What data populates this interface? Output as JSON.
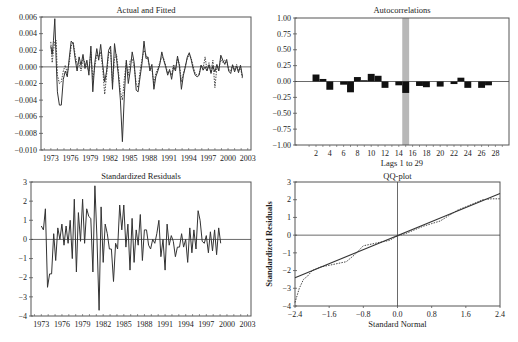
{
  "chart_data": [
    {
      "id": "actual_fitted",
      "type": "line",
      "title": "Actual and Fitted",
      "xlabel": "",
      "ylabel": "",
      "ylim": [
        -0.01,
        0.006
      ],
      "xlim": [
        1971.5,
        2003.5
      ],
      "yticks": [
        0.006,
        0.004,
        0.002,
        0.0,
        -0.002,
        -0.004,
        -0.006,
        -0.008,
        -0.01
      ],
      "ytick_labels": [
        "0.006",
        "0.004",
        "0.002",
        "0.000",
        "−0.002",
        "−0.004",
        "−0.006",
        "−0.008",
        "−0.010"
      ],
      "xticks": [
        1973,
        1976,
        1979,
        1982,
        1985,
        1988,
        1991,
        1994,
        1997,
        2000,
        2003
      ],
      "grid": false,
      "legend": "none",
      "series": [
        {
          "name": "Actual",
          "style": "solid",
          "x": [
            1973.0,
            1973.2,
            1973.4,
            1973.6,
            1973.8,
            1974.0,
            1974.3,
            1974.6,
            1974.9,
            1975.2,
            1975.5,
            1975.8,
            1976.1,
            1976.4,
            1976.7,
            1977.0,
            1977.3,
            1977.6,
            1977.9,
            1978.2,
            1978.5,
            1978.8,
            1979.1,
            1979.4,
            1979.7,
            1980.0,
            1980.3,
            1980.6,
            1980.9,
            1981.2,
            1981.5,
            1981.8,
            1982.1,
            1982.4,
            1982.7,
            1983.0,
            1983.3,
            1983.6,
            1983.9,
            1984.2,
            1984.5,
            1984.8,
            1985.1,
            1985.4,
            1985.7,
            1986.0,
            1986.3,
            1986.6,
            1986.9,
            1987.2,
            1987.5,
            1987.8,
            1988.1,
            1988.4,
            1988.7,
            1989.0,
            1989.3,
            1989.6,
            1989.9,
            1990.2,
            1990.5,
            1990.8,
            1991.1,
            1991.4,
            1991.7,
            1992.0,
            1992.3,
            1992.6,
            1992.9,
            1993.2,
            1993.5,
            1993.8,
            1994.1,
            1994.4,
            1994.7,
            1995.0,
            1995.3,
            1995.6,
            1995.9,
            1996.2,
            1996.5,
            1996.8,
            1997.1,
            1997.4,
            1997.7,
            1998.0,
            1998.3,
            1998.6,
            1998.9,
            1999.2,
            1999.5,
            1999.8,
            2000.1,
            2000.4,
            2000.7,
            2001.0,
            2001.3,
            2001.6,
            2001.9,
            2002.2
          ],
          "y": [
            0.0025,
            0.0015,
            0.0032,
            0.0058,
            0.001,
            -0.003,
            -0.0046,
            -0.0046,
            -0.0015,
            -0.0005,
            -0.0012,
            0.001,
            0.0031,
            0.0028,
            0.001,
            -0.0005,
            0.0012,
            0.0002,
            0.0015,
            -0.0002,
            0.0008,
            -0.001,
            0.0025,
            -0.003,
            0.0005,
            0.0022,
            0.0008,
            0.0027,
            0.0003,
            -0.0018,
            -0.0005,
            0.002,
            0.0025,
            -0.0027,
            0.0028,
            0.001,
            -0.001,
            -0.004,
            -0.009,
            -0.0035,
            0.0008,
            -0.002,
            -0.0005,
            0.0018,
            0.0005,
            -0.0028,
            -0.003,
            -0.0012,
            0.0005,
            0.0031,
            0.001,
            0.0012,
            -0.0005,
            0.0003,
            -0.0027,
            -0.0012,
            -0.0005,
            0.0003,
            0.0018,
            0.0008,
            0.0,
            -0.001,
            -0.0003,
            -0.0015,
            0.0,
            -0.0005,
            0.0013,
            0.0,
            -0.0027,
            -0.001,
            0.0,
            0.0012,
            0.0017,
            0.0008,
            -0.0003,
            -0.001,
            -0.0012,
            -0.001,
            0.0002,
            -0.0004,
            0.0,
            -0.0005,
            0.0002,
            -0.0008,
            0.0001,
            -0.0006,
            0.0003,
            -0.0005,
            0.0014,
            0.0008,
            0.0003,
            0.0009,
            -0.0005,
            -0.0008,
            0.0002,
            -0.0006,
            0.0001,
            -0.0007,
            0.0002,
            -0.0012
          ]
        },
        {
          "name": "Fitted",
          "style": "dotted",
          "x": [
            1973.0,
            1973.2,
            1973.4,
            1973.6,
            1973.8,
            1974.0,
            1974.3,
            1974.6,
            1974.9,
            1975.2,
            1975.5,
            1975.8,
            1976.1,
            1976.4,
            1976.7,
            1977.0,
            1977.3,
            1977.6,
            1977.9,
            1978.2,
            1978.5,
            1978.8,
            1979.1,
            1979.4,
            1979.7,
            1980.0,
            1980.3,
            1980.6,
            1980.9,
            1981.2,
            1981.5,
            1981.8,
            1982.1,
            1982.4,
            1982.7,
            1983.0,
            1983.3,
            1983.6,
            1983.9,
            1984.2,
            1984.5,
            1984.8,
            1985.1,
            1985.4,
            1985.7,
            1986.0,
            1986.3,
            1986.6,
            1986.9,
            1987.2,
            1987.5,
            1987.8,
            1988.1,
            1988.4,
            1988.7,
            1989.0,
            1989.3,
            1989.6,
            1989.9,
            1990.2,
            1990.5,
            1990.8,
            1991.1,
            1991.4,
            1991.7,
            1992.0,
            1992.3,
            1992.6,
            1992.9,
            1993.2,
            1993.5,
            1993.8,
            1994.1,
            1994.4,
            1994.7,
            1995.0,
            1995.3,
            1995.6,
            1995.9,
            1996.2,
            1996.5,
            1996.8,
            1997.1,
            1997.4,
            1997.7,
            1998.0,
            1998.3,
            1998.6,
            1998.9,
            1999.2,
            1999.5,
            1999.8,
            2000.1,
            2000.4,
            2000.7,
            2001.0,
            2001.3,
            2001.6,
            2001.9,
            2002.2
          ],
          "y": [
            0.003,
            0.0005,
            0.002,
            0.003,
            0.0032,
            -0.001,
            -0.002,
            -0.0018,
            -0.0005,
            0.0002,
            -0.0008,
            0.0005,
            0.0025,
            0.003,
            0.0015,
            0.0003,
            0.0005,
            -0.0005,
            0.001,
            0.0005,
            0.0,
            -0.0005,
            0.0018,
            -0.0015,
            0.0,
            0.0015,
            0.0012,
            0.0018,
            -0.0002,
            -0.0033,
            -0.001,
            0.0015,
            0.002,
            -0.002,
            0.001,
            0.0015,
            -0.0005,
            -0.003,
            -0.004,
            -0.0015,
            0.0005,
            -0.001,
            0.0008,
            0.001,
            0.0,
            -0.002,
            -0.0025,
            -0.0005,
            0.001,
            0.002,
            0.0015,
            0.0008,
            0.0,
            -0.0003,
            -0.002,
            -0.0008,
            -0.0002,
            0.0005,
            0.0012,
            0.001,
            0.0002,
            -0.0008,
            -0.0005,
            -0.001,
            0.0003,
            -0.0003,
            0.001,
            0.0003,
            -0.0018,
            -0.0008,
            0.0002,
            0.001,
            0.0015,
            0.001,
            0.0,
            -0.0008,
            -0.001,
            -0.0008,
            0.0002,
            -0.0002,
            0.0012,
            -0.0004,
            0.0005,
            -0.0006,
            0.0008,
            -0.0025,
            0.0,
            -0.0003,
            0.001,
            0.0005,
            0.0008,
            0.0006,
            -0.0003,
            -0.0005,
            0.0003,
            -0.0004,
            0.0003,
            -0.0005,
            0.0,
            -0.0015
          ]
        }
      ]
    },
    {
      "id": "autocorrelations",
      "type": "bar",
      "title": "Autocorrelations",
      "xlabel": "Lags 1 to 29",
      "ylabel": "",
      "ylim": [
        -1.0,
        1.0
      ],
      "yticks": [
        1.0,
        0.75,
        0.5,
        0.25,
        0.0,
        -0.25,
        -0.5,
        -0.75,
        -1.0
      ],
      "ytick_labels": [
        "1.00",
        "0.75",
        "0.50",
        "0.25",
        "0.00",
        "−0.25",
        "−0.50",
        "−0.75",
        "−1.00"
      ],
      "xticks": [
        2,
        4,
        6,
        8,
        10,
        12,
        14,
        16,
        18,
        20,
        22,
        24,
        26,
        28
      ],
      "highlight_lag": 15,
      "grid": false,
      "legend": "none",
      "categories": [
        1,
        2,
        3,
        4,
        5,
        6,
        7,
        8,
        9,
        10,
        11,
        12,
        13,
        14,
        15,
        16,
        17,
        18,
        19,
        20,
        21,
        22,
        23,
        24,
        25,
        26,
        27,
        28,
        29
      ],
      "values": [
        0.0,
        0.11,
        0.04,
        -0.13,
        0.0,
        -0.05,
        -0.17,
        0.07,
        0.02,
        0.12,
        0.09,
        -0.1,
        0.0,
        -0.06,
        -0.18,
        0.0,
        -0.07,
        -0.09,
        0.0,
        -0.08,
        0.0,
        -0.04,
        0.06,
        -0.1,
        0.0,
        -0.1,
        -0.06,
        0.0,
        0.0
      ]
    },
    {
      "id": "standardized_residuals",
      "type": "line",
      "title": "Standardized Residuals",
      "xlabel": "",
      "ylabel": "",
      "ylim": [
        -4,
        3
      ],
      "xlim": [
        1971.5,
        2003.5
      ],
      "yticks": [
        3,
        2,
        1,
        0,
        -1,
        -2,
        -3,
        -4
      ],
      "ytick_labels": [
        "3",
        "2",
        "1",
        "0",
        "−1",
        "−2",
        "−3",
        "−4"
      ],
      "xticks": [
        1973,
        1976,
        1979,
        1982,
        1985,
        1988,
        1991,
        1994,
        1997,
        2000,
        2003
      ],
      "grid": false,
      "legend": "none",
      "series": [
        {
          "name": "Standardized Residuals",
          "x": [
            1973.0,
            1973.3,
            1973.6,
            1973.9,
            1974.2,
            1974.5,
            1974.8,
            1975.1,
            1975.4,
            1975.7,
            1976.0,
            1976.3,
            1976.6,
            1976.9,
            1977.2,
            1977.5,
            1977.8,
            1978.1,
            1978.4,
            1978.7,
            1979.0,
            1979.3,
            1979.6,
            1979.9,
            1980.2,
            1980.5,
            1980.8,
            1981.1,
            1981.4,
            1981.7,
            1982.0,
            1982.3,
            1982.6,
            1982.9,
            1983.2,
            1983.5,
            1983.8,
            1984.1,
            1984.4,
            1984.7,
            1985.0,
            1985.3,
            1985.6,
            1985.9,
            1986.2,
            1986.5,
            1986.8,
            1987.1,
            1987.4,
            1987.7,
            1988.0,
            1988.3,
            1988.6,
            1988.9,
            1989.2,
            1989.5,
            1989.8,
            1990.1,
            1990.4,
            1990.7,
            1991.0,
            1991.3,
            1991.6,
            1991.9,
            1992.2,
            1992.5,
            1992.8,
            1993.1,
            1993.4,
            1993.7,
            1994.0,
            1994.3,
            1994.6,
            1994.9,
            1995.2,
            1995.5,
            1995.8,
            1996.1,
            1996.4,
            1996.7,
            1997.0,
            1997.3,
            1997.6,
            1997.9,
            1998.2,
            1998.5,
            1998.8,
            1999.1,
            1999.4,
            1999.7,
            2000.0,
            2000.3,
            2000.6,
            2000.9,
            2001.2,
            2001.5,
            2001.8,
            2002.1,
            2002.4
          ],
          "y": [
            0.7,
            0.5,
            1.6,
            -2.5,
            -1.8,
            -1.8,
            0.3,
            -1.1,
            0.6,
            0.0,
            0.8,
            -0.3,
            0.7,
            -0.2,
            1.0,
            -1.0,
            2.1,
            -1.7,
            1.4,
            -0.1,
            2.1,
            -0.2,
            1.6,
            1.2,
            1.1,
            -1.7,
            2.8,
            0.0,
            -3.7,
            1.7,
            -1.2,
            0.8,
            0.3,
            -0.5,
            -0.5,
            -2.2,
            -0.2,
            -0.5,
            1.8,
            0.5,
            1.8,
            -0.4,
            0.8,
            -1.6,
            1.1,
            -1.2,
            0.5,
            -0.3,
            1.3,
            -1.1,
            0.5,
            0.5,
            -0.3,
            -0.5,
            0.0,
            -0.2,
            0.3,
            1.0,
            -0.9,
            0.0,
            -1.6,
            0.8,
            -0.3,
            0.2,
            -0.1,
            -0.9,
            -0.4,
            -0.4,
            0.3,
            -0.4,
            0.0,
            -1.2,
            0.6,
            -0.7,
            0.5,
            -0.5,
            1.5,
            1.0,
            -0.1,
            -0.2,
            0.2,
            -0.7,
            0.4,
            -0.6,
            0.5,
            -0.8,
            0.6,
            -0.2
          ]
        }
      ]
    },
    {
      "id": "qq_plot",
      "type": "line",
      "title": "QQ-plot",
      "xlabel": "Standard Normal",
      "ylabel": "Standardized Residuals",
      "xlim": [
        -2.4,
        2.4
      ],
      "ylim": [
        -4,
        3
      ],
      "xticks": [
        -2.4,
        -1.6,
        -0.8,
        0.0,
        0.8,
        1.6,
        2.4
      ],
      "xtick_labels": [
        "−2.4",
        "−1.6",
        "−0.8",
        "0.0",
        "0.8",
        "1.6",
        "2.4"
      ],
      "yticks": [
        3,
        2,
        1,
        0,
        -1,
        -2,
        -3,
        -4
      ],
      "ytick_labels": [
        "3",
        "2",
        "1",
        "0",
        "−1",
        "−2",
        "−3",
        "−4"
      ],
      "grid": false,
      "legend": "none",
      "series": [
        {
          "name": "Reference line",
          "style": "solid",
          "x": [
            -2.4,
            2.4
          ],
          "y": [
            -2.4,
            2.35
          ]
        },
        {
          "name": "Empirical quantiles",
          "style": "dotted",
          "x": [
            -2.4,
            -2.3,
            -2.2,
            -2.1,
            -2.0,
            -1.8,
            -1.6,
            -1.4,
            -1.2,
            -1.0,
            -0.8,
            -0.6,
            -0.4,
            -0.2,
            0.0,
            0.2,
            0.4,
            0.6,
            0.8,
            1.0,
            1.2,
            1.4,
            1.6,
            1.8,
            2.0,
            2.2,
            2.4
          ],
          "y": [
            -3.8,
            -3.0,
            -2.5,
            -2.3,
            -2.0,
            -1.8,
            -1.7,
            -1.6,
            -1.5,
            -1.1,
            -0.6,
            -0.5,
            -0.4,
            -0.3,
            -0.05,
            0.1,
            0.3,
            0.5,
            0.65,
            0.8,
            1.1,
            1.4,
            1.6,
            1.8,
            2.0,
            2.05,
            2.05
          ]
        }
      ]
    }
  ]
}
